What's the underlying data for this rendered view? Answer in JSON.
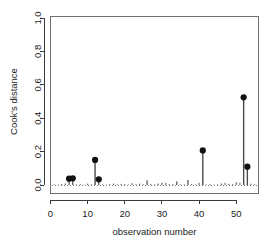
{
  "chart_data": {
    "type": "bar",
    "title": "",
    "subtitle": "",
    "xlabel": "observation number",
    "ylabel": "Cook's distance",
    "xlim": [
      0,
      56
    ],
    "ylim": [
      0.0,
      1.05
    ],
    "grid": false,
    "legend": null,
    "xticks": [
      0,
      10,
      20,
      30,
      40,
      50
    ],
    "xtick_labels": [
      "0",
      "10",
      "20",
      "30",
      "40",
      "50"
    ],
    "yticks": [
      0.0,
      0.2,
      0.4,
      0.6,
      0.8,
      1.0
    ],
    "ytick_labels": [
      "0.0",
      "0.2",
      "0.4",
      "0.6",
      "0.8",
      "1.0"
    ],
    "threshold_line": {
      "value": 0.7,
      "style": "dashed",
      "label": ""
    },
    "baseline": {
      "value": 0.0,
      "style": "dotted"
    },
    "labeled_points": [
      {
        "x": 5,
        "y": 0.038
      },
      {
        "x": 6,
        "y": 0.04
      },
      {
        "x": 12,
        "y": 0.15
      },
      {
        "x": 13,
        "y": 0.034
      },
      {
        "x": 41,
        "y": 0.207
      },
      {
        "x": 52,
        "y": 0.525
      },
      {
        "x": 53,
        "y": 0.11
      }
    ],
    "x": [
      1,
      2,
      3,
      4,
      5,
      6,
      7,
      8,
      9,
      10,
      11,
      12,
      13,
      14,
      15,
      16,
      17,
      18,
      19,
      20,
      21,
      22,
      23,
      24,
      25,
      26,
      27,
      28,
      29,
      30,
      31,
      32,
      33,
      34,
      35,
      36,
      37,
      38,
      39,
      40,
      41,
      42,
      43,
      44,
      45,
      46,
      47,
      48,
      49,
      50,
      51,
      52,
      53,
      54,
      55,
      56
    ],
    "values": [
      0.004,
      0.002,
      0.006,
      0.009,
      0.038,
      0.04,
      0.003,
      0.005,
      0.002,
      0.008,
      0.004,
      0.15,
      0.034,
      0.003,
      0.002,
      0.005,
      0.009,
      0.004,
      0.007,
      0.006,
      0.003,
      0.011,
      0.005,
      0.008,
      0.004,
      0.028,
      0.006,
      0.003,
      0.009,
      0.014,
      0.012,
      0.005,
      0.007,
      0.021,
      0.004,
      0.003,
      0.03,
      0.006,
      0.004,
      0.013,
      0.207,
      0.003,
      0.005,
      0.002,
      0.004,
      0.009,
      0.013,
      0.007,
      0.004,
      0.016,
      0.013,
      0.525,
      0.11,
      0.008,
      0.005,
      0.003
    ]
  },
  "axes": {
    "y_title": "Cook's distance",
    "x_title": "observation number"
  }
}
